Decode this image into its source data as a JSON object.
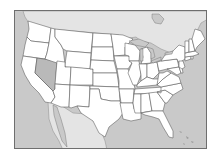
{
  "map": {
    "title": "United States state outline map",
    "highlighted_state": "Nevada",
    "colors": {
      "ocean": "#c9c9c9",
      "neighbor_land": "#e4e4e4",
      "state_fill": "#ffffff",
      "highlight_fill": "#b9b9b9",
      "border": "#555555",
      "frame": "#6e6e6e"
    },
    "regions": [
      "Canada",
      "Mexico",
      "Pacific Ocean",
      "Atlantic Ocean",
      "Gulf of Mexico",
      "Great Lakes",
      "Bahamas"
    ],
    "states": [
      "Washington",
      "Oregon",
      "California",
      "Nevada",
      "Idaho",
      "Montana",
      "Wyoming",
      "Utah",
      "Arizona",
      "Colorado",
      "New Mexico",
      "North Dakota",
      "South Dakota",
      "Nebraska",
      "Kansas",
      "Oklahoma",
      "Texas",
      "Minnesota",
      "Iowa",
      "Missouri",
      "Arkansas",
      "Louisiana",
      "Wisconsin",
      "Illinois",
      "Michigan",
      "Indiana",
      "Ohio",
      "Kentucky",
      "Tennessee",
      "Mississippi",
      "Alabama",
      "Georgia",
      "Florida",
      "South Carolina",
      "North Carolina",
      "Virginia",
      "West Virginia",
      "Pennsylvania",
      "New York",
      "Maryland",
      "Delaware",
      "New Jersey",
      "Connecticut",
      "Rhode Island",
      "Massachusetts",
      "Vermont",
      "New Hampshire",
      "Maine"
    ]
  }
}
